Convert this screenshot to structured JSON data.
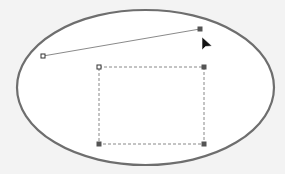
{
  "canvas": {
    "background": "#f3f3f3",
    "ellipse": {
      "cx": 145.5,
      "cy": 87.5,
      "rx": 128.5,
      "ry": 77.5,
      "fill": "#ffffff",
      "stroke": "#6e6e6e",
      "stroke_width": 2.2
    },
    "line": {
      "x1": 43,
      "y1": 56,
      "x2": 200,
      "y2": 29,
      "stroke": "#8a8a8a"
    },
    "line_handles": {
      "start": {
        "x": 43,
        "y": 56,
        "style": "hollow-square"
      },
      "end": {
        "x": 200,
        "y": 29,
        "style": "filled-square"
      }
    },
    "selection_rect": {
      "x": 99,
      "y": 67,
      "width": 105,
      "height": 77,
      "stroke": "#888888",
      "dash": "3,2"
    },
    "selection_handles": [
      {
        "x": 99,
        "y": 67,
        "style": "hollow-square"
      },
      {
        "x": 204,
        "y": 67,
        "style": "filled-square"
      },
      {
        "x": 99,
        "y": 144,
        "style": "filled-square"
      },
      {
        "x": 204,
        "y": 144,
        "style": "filled-square"
      }
    ],
    "cursor": {
      "x": 202,
      "y": 37,
      "icon": "arrow-cursor-icon"
    }
  }
}
